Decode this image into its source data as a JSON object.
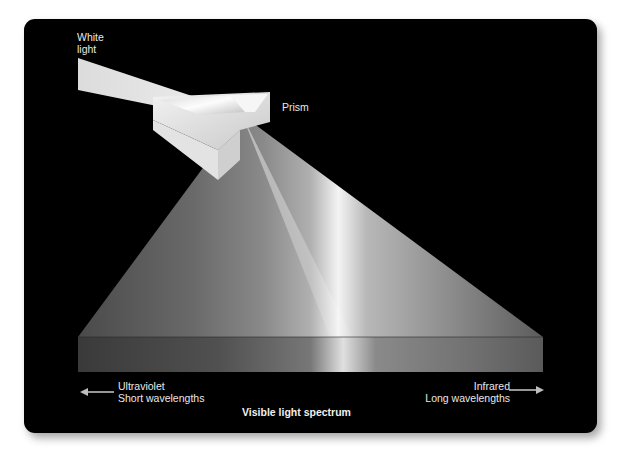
{
  "diagram": {
    "title": "Visible light spectrum",
    "labels": {
      "input_beam": [
        "White",
        "light"
      ],
      "prism": "Prism",
      "left_end": [
        "Ultraviolet",
        "Short wavelengths"
      ],
      "right_end": [
        "Infrared",
        "Long wavelengths"
      ]
    },
    "arrows": {
      "left": "arrow-left",
      "right": "arrow-right"
    },
    "colors": {
      "background": "#000000",
      "page": "#ffffff",
      "text": "#e8e8e8",
      "beam": "#e6e6e6",
      "spectrum_highlight": "#f5f5f5"
    }
  }
}
